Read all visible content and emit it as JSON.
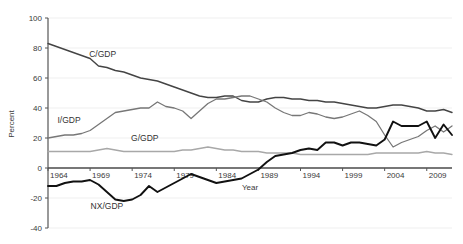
{
  "chart_data": {
    "type": "line",
    "title": "",
    "xlabel": "Year",
    "ylabel": "Percent",
    "xlim": [
      1964,
      2012
    ],
    "ylim": [
      -40,
      100
    ],
    "xticks": [
      "1964",
      "1969",
      "1974",
      "1979",
      "1984",
      "1989",
      "1994",
      "1999",
      "2004",
      "2009"
    ],
    "xtick_values": [
      1964,
      1969,
      1974,
      1979,
      1984,
      1989,
      1994,
      1999,
      2004,
      2009
    ],
    "yticks": [
      "100",
      "80",
      "60",
      "40",
      "20",
      "0",
      "-20",
      "-40"
    ],
    "ytick_values": [
      100,
      80,
      60,
      40,
      20,
      0,
      -20,
      -40
    ],
    "grid": true,
    "grid_axis": "y",
    "legend_position": "inline-annotation",
    "x": [
      1964,
      1965,
      1966,
      1967,
      1968,
      1969,
      1970,
      1971,
      1972,
      1973,
      1974,
      1975,
      1976,
      1977,
      1978,
      1979,
      1980,
      1981,
      1982,
      1983,
      1984,
      1985,
      1986,
      1987,
      1988,
      1989,
      1990,
      1991,
      1992,
      1993,
      1994,
      1995,
      1996,
      1997,
      1998,
      1999,
      2000,
      2001,
      2002,
      2003,
      2004,
      2005,
      2006,
      2007,
      2008,
      2009,
      2010,
      2011,
      2012
    ],
    "series": [
      {
        "name": "C/GDP",
        "color": "#444444",
        "width": 1.4,
        "label_x": 1970.5,
        "label_y": 74,
        "values": [
          83,
          81,
          79,
          77,
          75,
          73,
          68,
          67,
          65,
          64,
          62,
          60,
          59,
          58,
          56,
          54,
          52,
          50,
          48,
          47,
          47,
          48,
          48,
          45,
          44,
          44,
          46,
          47,
          47,
          46,
          46,
          45,
          45,
          44,
          44,
          43,
          42,
          41,
          40,
          40,
          41,
          42,
          42,
          41,
          40,
          38,
          38,
          39,
          37
        ]
      },
      {
        "name": "I/GDP",
        "color": "#777777",
        "width": 1.3,
        "label_x": 1966.5,
        "label_y": 30,
        "values": [
          20,
          21,
          22,
          22,
          23,
          25,
          29,
          33,
          37,
          38,
          39,
          40,
          40,
          44,
          41,
          40,
          38,
          33,
          38,
          43,
          46,
          46,
          47,
          48,
          48,
          46,
          44,
          40,
          37,
          35,
          35,
          37,
          36,
          34,
          33,
          34,
          36,
          38,
          35,
          31,
          22,
          14,
          17,
          19,
          21,
          25,
          28,
          24,
          28
        ]
      },
      {
        "name": "G/GDP",
        "color": "#a8a8a8",
        "width": 1.3,
        "label_x": 1975.5,
        "label_y": 18,
        "values": [
          11,
          11,
          11,
          11,
          11,
          11,
          12,
          13,
          12,
          11,
          11,
          11,
          11,
          11,
          11,
          11,
          12,
          12,
          13,
          14,
          13,
          12,
          12,
          11,
          11,
          11,
          10,
          10,
          10,
          10,
          9,
          9,
          9,
          9,
          9,
          9,
          9,
          9,
          9,
          10,
          10,
          10,
          10,
          10,
          10,
          11,
          10,
          10,
          9
        ]
      },
      {
        "name": "NX/GDP",
        "color": "#111111",
        "width": 1.9,
        "label_x": 1971.0,
        "label_y": -27,
        "values": [
          -12,
          -12,
          -10,
          -9,
          -9,
          -8,
          -11,
          -16,
          -21,
          -22,
          -21,
          -18,
          -12,
          -16,
          -13,
          -10,
          -7,
          -4,
          -6,
          -8,
          -10,
          -9,
          -8,
          -7,
          -4,
          -1,
          4,
          8,
          9,
          10,
          12,
          13,
          12,
          17,
          17,
          15,
          17,
          17,
          16,
          15,
          19,
          31,
          28,
          28,
          28,
          31,
          20,
          29,
          22
        ]
      }
    ]
  }
}
